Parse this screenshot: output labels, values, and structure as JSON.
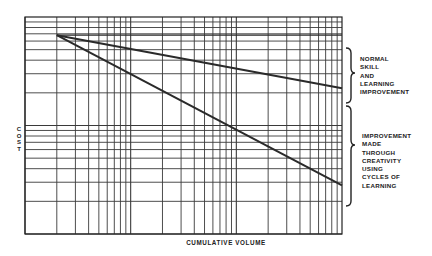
{
  "chart_data": {
    "type": "line",
    "title": "",
    "xlabel": "CUMULATIVE VOLUME",
    "ylabel": "COST",
    "xscale": "log",
    "yscale": "log",
    "x_decades": 3,
    "y_decades": 2,
    "grid": true,
    "tick_labels_shown": false,
    "series": [
      {
        "name": "Normal skill and learning improvement",
        "points": [
          {
            "x": 2,
            "y": 68
          },
          {
            "x": 1000,
            "y": 22
          }
        ]
      },
      {
        "name": "Improvement made through creativity using cycles of learning",
        "points": [
          {
            "x": 2,
            "y": 68
          },
          {
            "x": 1000,
            "y": 2.8
          }
        ]
      }
    ],
    "annotations": [
      {
        "text": [
          "NORMAL",
          "SKILL",
          "AND",
          "LEARNING",
          "IMPROVEMENT"
        ],
        "type": "brace",
        "spans": "gap between flat start level and upper line end"
      },
      {
        "text": [
          "IMPROVEMENT",
          "MADE",
          "THROUGH",
          "CREATIVITY",
          "USING",
          "CYCLES OF",
          "LEARNING"
        ],
        "type": "brace",
        "spans": "gap between upper line end and lower line end"
      }
    ]
  },
  "labels": {
    "y_axis_letters": [
      "C",
      "O",
      "S",
      "T"
    ],
    "x_axis": "CUMULATIVE VOLUME",
    "upper_annotation": [
      "NORMAL",
      "SKILL",
      "AND",
      "LEARNING",
      "IMPROVEMENT"
    ],
    "lower_annotation": [
      "IMPROVEMENT",
      "MADE",
      "THROUGH",
      "CREATIVITY",
      "USING",
      "CYCLES OF",
      "LEARNING"
    ]
  },
  "layout": {
    "plot": {
      "left": 25,
      "top": 17,
      "right": 342,
      "bottom": 234
    },
    "line_color": "#2a2a2a",
    "grid_color": "#3a3a3a"
  }
}
